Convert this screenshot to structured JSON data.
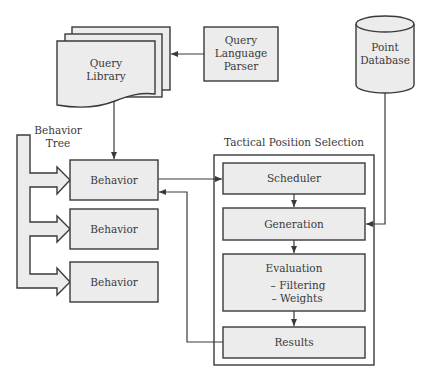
{
  "diagram": {
    "query_library": {
      "label_lines": [
        "Query",
        "Library"
      ]
    },
    "query_language_parser": {
      "label_lines": [
        "Query",
        "Language",
        "Parser"
      ]
    },
    "point_database": {
      "label_lines": [
        "Point",
        "Database"
      ]
    },
    "behavior_tree": {
      "label_lines": [
        "Behavior",
        "Tree"
      ]
    },
    "behaviors": [
      {
        "label": "Behavior"
      },
      {
        "label": "Behavior"
      },
      {
        "label": "Behavior"
      }
    ],
    "tactical_position_selection": {
      "title": "Tactical Position Selection",
      "stages": {
        "scheduler": "Scheduler",
        "generation": "Generation",
        "evaluation": {
          "label": "Evaluation",
          "items": [
            "– Filtering",
            "– Weights"
          ]
        },
        "results": "Results"
      }
    },
    "colors": {
      "box_fill": "#ececec",
      "stroke": "#3a3a3a",
      "text": "#3a3a3a",
      "background": "#ffffff"
    }
  }
}
